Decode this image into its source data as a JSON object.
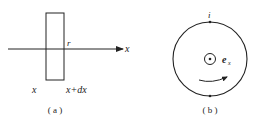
{
  "panel_a": {
    "axis_label": "x",
    "point_label": "r",
    "left_label": "x",
    "right_label": "x+dx",
    "caption": "( a )"
  },
  "panel_b": {
    "current_label": "i",
    "field_label": "e",
    "field_subscript": "x",
    "caption": "( b )"
  },
  "colors": {
    "stroke": "#222222",
    "background": "#ffffff"
  }
}
